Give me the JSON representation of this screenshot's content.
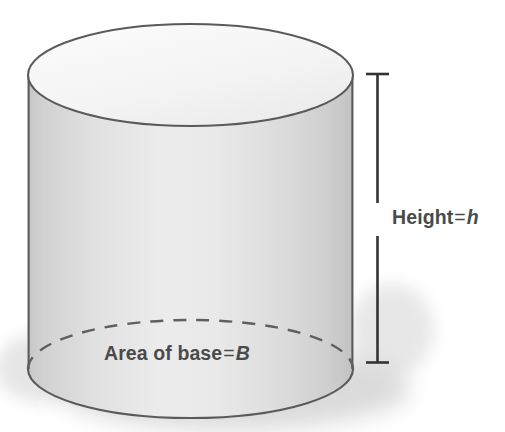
{
  "figure": {
    "type": "geometry-diagram",
    "shape": "cylinder",
    "background_color": "#ffffff",
    "outline_color": "#5a5a5a",
    "body_fill_light": "#f2f2f2",
    "body_fill_dark": "#c9c9c9",
    "top_face_fill": "#f7f7f7",
    "text_color": "#4a4a4a",
    "shadow_color": "#c4c4c4"
  },
  "labels": {
    "height": {
      "prefix": "Height",
      "equals": "=",
      "variable": "h",
      "full_text": "Height = h"
    },
    "base": {
      "prefix": "Area of base",
      "equals": "=",
      "variable": "B",
      "full_text": "Area of base = B"
    }
  },
  "annotations": {
    "height_measure": {
      "name": "height-measure-bar",
      "style": "vertical line with end serifs, broken for label"
    },
    "hidden_base_edge": {
      "name": "dashed-base-ellipse",
      "style": "dashed"
    }
  }
}
